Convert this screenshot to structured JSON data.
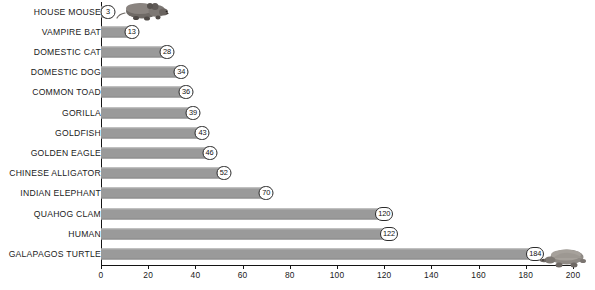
{
  "chart_data": {
    "type": "bar",
    "orientation": "horizontal",
    "title": "",
    "xlabel": "",
    "ylabel": "",
    "xlim": [
      0,
      200
    ],
    "xticks": [
      0,
      20,
      40,
      60,
      80,
      100,
      120,
      140,
      160,
      180,
      200
    ],
    "xtick_labels": [
      "0",
      "20",
      "40",
      "60",
      "80",
      "100",
      "120",
      "140",
      "160",
      "180",
      "200"
    ],
    "grid": false,
    "legend": "none",
    "bar_color": "#9a9a9a",
    "axis_color": "#141414",
    "categories": [
      "HOUSE MOUSE",
      "VAMPIRE BAT",
      "DOMESTIC CAT",
      "DOMESTIC DOG",
      "COMMON TOAD",
      "GORILLA",
      "GOLDFISH",
      "GOLDEN EAGLE",
      "CHINESE ALLIGATOR",
      "INDIAN ELEPHANT",
      "QUAHOG CLAM",
      "HUMAN",
      "GALAPAGOS TURTLE"
    ],
    "values": [
      3,
      13,
      28,
      34,
      36,
      39,
      43,
      46,
      52,
      70,
      120,
      122,
      184
    ],
    "value_labels": [
      "3",
      "13",
      "28",
      "34",
      "36",
      "39",
      "43",
      "46",
      "52",
      "70",
      "120",
      "122",
      "184"
    ]
  },
  "decorations": {
    "mouse_icon": "mouse-illustration",
    "turtle_icon": "tortoise-illustration"
  },
  "caption": {
    "cropped_text": ""
  }
}
